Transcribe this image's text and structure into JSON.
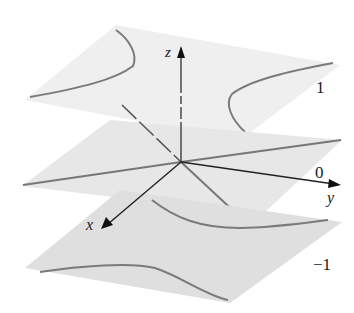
{
  "figure": {
    "colors": {
      "background": "#ffffff",
      "plane_top": "#eeeeee",
      "plane_mid": "#e6e6e6",
      "plane_bottom": "#dedede",
      "curve": "#777777",
      "axis": "#222222"
    },
    "axes": {
      "z_label": "z",
      "y_label": "y",
      "x_label": "x"
    },
    "planes": [
      {
        "level_label": "1",
        "z": 1
      },
      {
        "level_label": "0",
        "z": 0
      },
      {
        "level_label": "−1",
        "z": -1
      }
    ]
  }
}
